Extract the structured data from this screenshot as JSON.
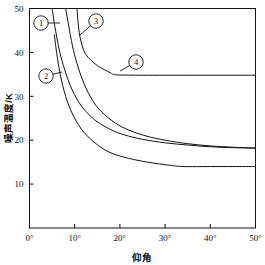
{
  "chart_data": {
    "type": "line",
    "title": "",
    "xlabel": "仰角",
    "ylabel": "噪声温度/K",
    "xlim": [
      0,
      50
    ],
    "ylim": [
      0,
      50
    ],
    "grid": false,
    "legend_position": "inline-callouts",
    "x_unit": "°",
    "x_ticks": [
      0,
      10,
      20,
      30,
      40,
      50
    ],
    "x_tick_labels": [
      "0°",
      "10°",
      "20°",
      "30°",
      "40°",
      "50°"
    ],
    "y_ticks": [
      10,
      20,
      30,
      40,
      50
    ],
    "y_tick_labels": [
      "10",
      "20",
      "30",
      "40",
      "50"
    ],
    "series": [
      {
        "name": "1",
        "callout_label": "①",
        "x": [
          5.0,
          5.6,
          6.5,
          7.5,
          9.0,
          11.0,
          13.0,
          15.0,
          18.0,
          21.0,
          25.0,
          30.0,
          35.0,
          40.0,
          45.0,
          50.0
        ],
        "values": [
          50.0,
          46.0,
          41.0,
          37.0,
          32.5,
          28.5,
          26.0,
          24.2,
          22.4,
          21.2,
          20.2,
          19.4,
          18.9,
          18.5,
          18.3,
          18.2
        ]
      },
      {
        "name": "2",
        "callout_label": "②",
        "x": [
          5.5,
          6.0,
          6.8,
          8.0,
          9.5,
          11.5,
          14.0,
          17.0,
          20.0,
          24.0,
          28.0,
          31.0,
          34.0,
          40.0,
          45.0,
          50.0
        ],
        "values": [
          44.0,
          40.0,
          35.0,
          30.0,
          26.0,
          22.5,
          19.8,
          17.6,
          16.4,
          15.4,
          14.7,
          14.3,
          14.0,
          14.0,
          14.0,
          14.0
        ]
      },
      {
        "name": "3",
        "callout_label": "③",
        "x": [
          8.0,
          8.6,
          9.5,
          10.5,
          12.0,
          14.0,
          16.0,
          19.0,
          22.0,
          26.0,
          30.0,
          35.0,
          40.0,
          45.0,
          50.0
        ],
        "values": [
          50.0,
          46.5,
          41.5,
          37.5,
          33.0,
          29.0,
          26.4,
          23.9,
          22.3,
          20.9,
          20.0,
          19.2,
          18.7,
          18.4,
          18.2
        ]
      },
      {
        "name": "4",
        "callout_label": "④",
        "x": [
          10.5,
          11.0,
          11.8,
          12.5,
          13.5,
          15.0,
          16.5,
          18.0,
          19.2,
          25.0,
          30.0,
          35.0,
          40.0,
          45.0,
          50.0
        ],
        "values": [
          50.0,
          44.5,
          41.0,
          39.5,
          38.3,
          37.0,
          36.1,
          35.3,
          34.9,
          34.8,
          34.8,
          34.8,
          34.8,
          34.8,
          34.8
        ]
      }
    ],
    "callouts": [
      {
        "label": "①",
        "cx": 41,
        "cy": 23,
        "anchor_x": 60,
        "anchor_y": 23
      },
      {
        "label": "②",
        "cx": 46,
        "cy": 76,
        "anchor_x": 62,
        "anchor_y": 72
      },
      {
        "label": "③",
        "cx": 96,
        "cy": 21,
        "anchor_x": 80,
        "anchor_y": 35
      },
      {
        "label": "④",
        "cx": 136,
        "cy": 62,
        "anchor_x": 120,
        "anchor_y": 71
      }
    ]
  }
}
